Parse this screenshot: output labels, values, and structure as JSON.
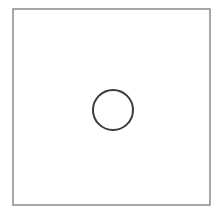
{
  "diagram": {
    "frame": {
      "shape": "square",
      "x": 13,
      "y": 9,
      "width": 197,
      "height": 196,
      "stroke": "#8a8a8a",
      "stroke_width": 1.5
    },
    "circle": {
      "shape": "circle",
      "cx": 113,
      "cy": 110,
      "r": 20,
      "stroke": "#3a3a3a",
      "stroke_width": 2
    },
    "background": "#ffffff"
  }
}
